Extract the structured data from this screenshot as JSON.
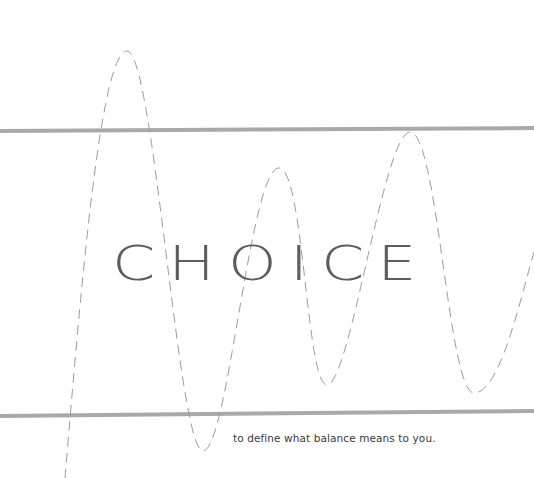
{
  "artwork": {
    "title_word": "CHOICE",
    "subtitle": "to define what balance means to you.",
    "colors": {
      "background": "#ffffff",
      "band_lines": "#a9a9a9",
      "wave_dash": "#9a9a9a",
      "title_text": "#5d5d5d",
      "subtitle_text": "#3a3a3a"
    },
    "band_lines": [
      {
        "name": "top-band-line",
        "y_left": 131,
        "y_right": 128,
        "thickness": 4
      },
      {
        "name": "bottom-band-line",
        "y_left": 416,
        "y_right": 411,
        "thickness": 4
      }
    ],
    "wave": {
      "style": "dashed",
      "extrema": [
        {
          "type": "start",
          "x": 65,
          "y": 478
        },
        {
          "type": "peak",
          "x": 127,
          "y": 51
        },
        {
          "type": "trough",
          "x": 203,
          "y": 451
        },
        {
          "type": "peak",
          "x": 279,
          "y": 168
        },
        {
          "type": "trough",
          "x": 327,
          "y": 385
        },
        {
          "type": "peak",
          "x": 410,
          "y": 132
        },
        {
          "type": "trough",
          "x": 474,
          "y": 393
        },
        {
          "type": "end",
          "x": 534,
          "y": 252
        }
      ]
    }
  }
}
